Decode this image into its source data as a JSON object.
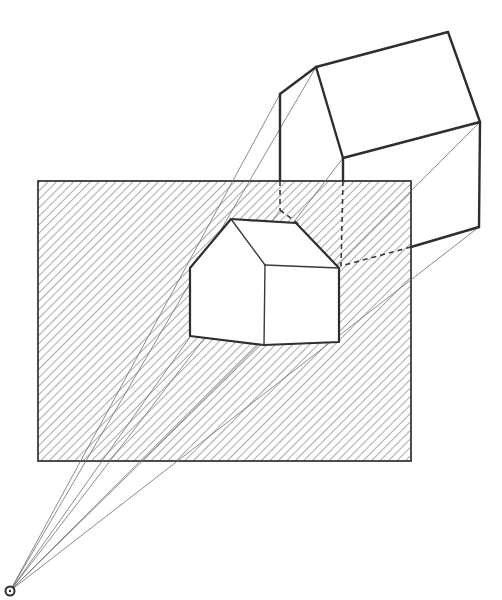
{
  "figure": {
    "description": "Perspective projection of a house through a hatched picture plane to a station point",
    "colors": {
      "ink": "#3a3a3a",
      "ink_dark": "#2e2e2e",
      "projector": "#6e6e6e",
      "hatch": "#7a7a7a",
      "background": "#ffffff"
    },
    "station_point": {
      "x": 10,
      "y": 591,
      "r": 4.5
    },
    "picture_plane": {
      "x": 38,
      "y": 181,
      "width": 373,
      "height": 280,
      "hatch_spacing": 6,
      "hatch_angle_deg": 45
    },
    "real_house": {
      "solid_edges": [
        [
          [
            280,
            94
          ],
          [
            316,
            67
          ]
        ],
        [
          [
            316,
            67
          ],
          [
            448,
            32
          ]
        ],
        [
          [
            448,
            32
          ],
          [
            480,
            122
          ]
        ],
        [
          [
            316,
            67
          ],
          [
            343,
            158
          ]
        ],
        [
          [
            343,
            158
          ],
          [
            480,
            122
          ]
        ],
        [
          [
            480,
            122
          ],
          [
            479,
            227
          ]
        ],
        [
          [
            479,
            227
          ],
          [
            411,
            247
          ]
        ],
        [
          [
            280,
            94
          ],
          [
            280,
            181
          ]
        ],
        [
          [
            343,
            158
          ],
          [
            343,
            181
          ]
        ]
      ],
      "hidden_edges": [
        [
          [
            280,
            181
          ],
          [
            280,
            210
          ]
        ],
        [
          [
            343,
            181
          ],
          [
            341,
            266
          ]
        ],
        [
          [
            411,
            247
          ],
          [
            341,
            266
          ]
        ],
        [
          [
            280,
            210
          ],
          [
            301,
            226
          ]
        ]
      ]
    },
    "projected_house": {
      "outline": [
        [
          190,
          268
        ],
        [
          231,
          219
        ],
        [
          296,
          223
        ],
        [
          339,
          268
        ],
        [
          339,
          342
        ],
        [
          264,
          345
        ],
        [
          190,
          336
        ]
      ],
      "inner_edges": [
        [
          [
            231,
            219
          ],
          [
            265,
            265
          ]
        ],
        [
          [
            265,
            265
          ],
          [
            339,
            268
          ]
        ],
        [
          [
            265,
            265
          ],
          [
            264,
            345
          ]
        ]
      ]
    },
    "projectors": [
      [
        [
          10,
          591
        ],
        [
          280,
          94
        ]
      ],
      [
        [
          10,
          591
        ],
        [
          316,
          67
        ]
      ],
      [
        [
          10,
          591
        ],
        [
          343,
          158
        ]
      ],
      [
        [
          10,
          591
        ],
        [
          480,
          122
        ]
      ],
      [
        [
          10,
          591
        ],
        [
          479,
          227
        ]
      ],
      [
        [
          10,
          591
        ],
        [
          341,
          266
        ]
      ],
      [
        [
          10,
          591
        ],
        [
          280,
          210
        ]
      ]
    ]
  }
}
